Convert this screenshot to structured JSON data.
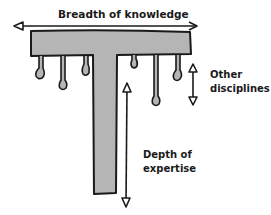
{
  "diagram": {
    "title_top": "Breadth of knowledge",
    "label_right_line1": "Other",
    "label_right_line2": "disciplines",
    "label_depth_line1": "Depth of",
    "label_depth_line2": "expertise",
    "colors": {
      "fill": "#b5b5b5",
      "stroke": "#1a1a1a",
      "background": "#ffffff"
    }
  }
}
